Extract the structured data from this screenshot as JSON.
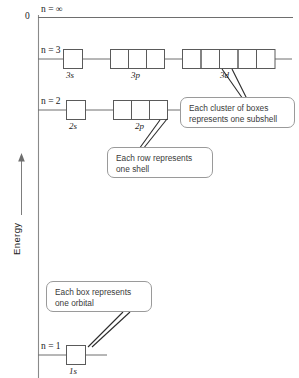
{
  "figure": {
    "axis": {
      "title": "Energy",
      "zero_label": "0",
      "arrow": "up-arrow"
    },
    "levels": [
      {
        "id": "n-infinity",
        "label_n": "n",
        "label_eq": "=",
        "label_val": "∞",
        "full": "n = ∞"
      },
      {
        "id": "n-3",
        "label_n": "n",
        "label_eq": "=",
        "label_val": "3",
        "full": "n = 3"
      },
      {
        "id": "n-2",
        "label_n": "n",
        "label_eq": "=",
        "label_val": "2",
        "full": "n = 2"
      },
      {
        "id": "n-1",
        "label_n": "n",
        "label_eq": "=",
        "label_val": "1",
        "full": "n = 1"
      }
    ],
    "subshells": [
      {
        "id": "3s",
        "label": "3s",
        "boxes": 1,
        "shell": 3
      },
      {
        "id": "3p",
        "label": "3p",
        "boxes": 3,
        "shell": 3
      },
      {
        "id": "3d",
        "label": "3d",
        "boxes": 5,
        "shell": 3
      },
      {
        "id": "2s",
        "label": "2s",
        "boxes": 1,
        "shell": 2
      },
      {
        "id": "2p",
        "label": "2p",
        "boxes": 3,
        "shell": 2
      },
      {
        "id": "1s",
        "label": "1s",
        "boxes": 1,
        "shell": 1
      }
    ],
    "callouts": [
      {
        "id": "subshell-callout",
        "line1": "Each cluster of boxes",
        "line2": "represents one subshell"
      },
      {
        "id": "shell-callout",
        "line1": "Each row represents",
        "line2": "one shell"
      },
      {
        "id": "orbital-callout",
        "line1": "Each box represents",
        "line2": "one orbital"
      }
    ],
    "colors": {
      "line": "#6e6e6e",
      "box_stroke": "#5a5a5a",
      "callout_stroke": "#9a9a9a",
      "text": "#1a1a1a",
      "callout_text": "#3a3a3a",
      "background": "#ffffff"
    }
  }
}
